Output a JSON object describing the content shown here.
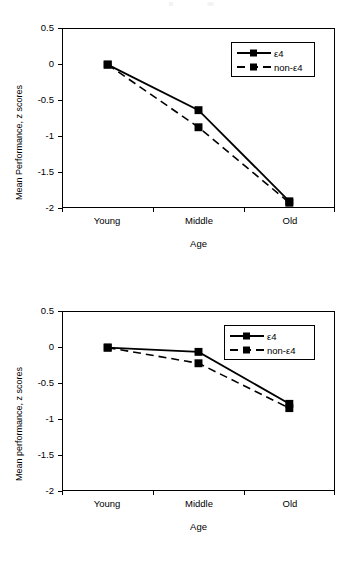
{
  "figure": {
    "background_color": "#ffffff",
    "series_color": "#000000"
  },
  "charts": [
    {
      "id": "top-chart",
      "ylabel": "Mean Performance, z scores",
      "xlabel": "Age",
      "y_ticks": [
        "0.5",
        "0",
        "-0.5",
        "-1",
        "-1.5",
        "-2"
      ],
      "x_ticks": [
        "Young",
        "Middle",
        "Old"
      ],
      "legend": [
        {
          "label": "ε4",
          "style": "solid"
        },
        {
          "label": "non-ε4",
          "style": "dashed"
        }
      ]
    },
    {
      "id": "bottom-chart",
      "ylabel": "Mean performance, z scores",
      "xlabel": "Age",
      "y_ticks": [
        "0.5",
        "0",
        "-0.5",
        "-1",
        "-1.5",
        "-2"
      ],
      "x_ticks": [
        "Young",
        "Middle",
        "Old"
      ],
      "legend": [
        {
          "label": "ε4",
          "style": "solid"
        },
        {
          "label": "non-ε4",
          "style": "dashed"
        }
      ]
    }
  ],
  "chart_data": [
    {
      "type": "line",
      "id": "top-chart",
      "title": "",
      "xlabel": "Age",
      "ylabel": "Mean Performance, z scores",
      "categories": [
        "Young",
        "Middle",
        "Old"
      ],
      "ylim": [
        -2,
        0.5
      ],
      "yticks": [
        0.5,
        0,
        -0.5,
        -1,
        -1.5,
        -2
      ],
      "grid": false,
      "legend_position": "top-right",
      "series": [
        {
          "name": "ε4",
          "style": "solid",
          "marker": "square",
          "values": [
            0.0,
            -0.64,
            -1.92
          ]
        },
        {
          "name": "non-ε4",
          "style": "dashed",
          "marker": "square",
          "values": [
            0.0,
            -0.88,
            -1.94
          ]
        }
      ]
    },
    {
      "type": "line",
      "id": "bottom-chart",
      "title": "",
      "xlabel": "Age",
      "ylabel": "Mean performance, z scores",
      "categories": [
        "Young",
        "Middle",
        "Old"
      ],
      "ylim": [
        -2,
        0.5
      ],
      "yticks": [
        0.5,
        0,
        -0.5,
        -1,
        -1.5,
        -2
      ],
      "grid": false,
      "legend_position": "top-right",
      "series": [
        {
          "name": "ε4",
          "style": "solid",
          "marker": "square",
          "values": [
            0.0,
            -0.06,
            -0.79
          ]
        },
        {
          "name": "non-ε4",
          "style": "dashed",
          "marker": "square",
          "values": [
            0.0,
            -0.22,
            -0.85
          ]
        }
      ]
    }
  ]
}
